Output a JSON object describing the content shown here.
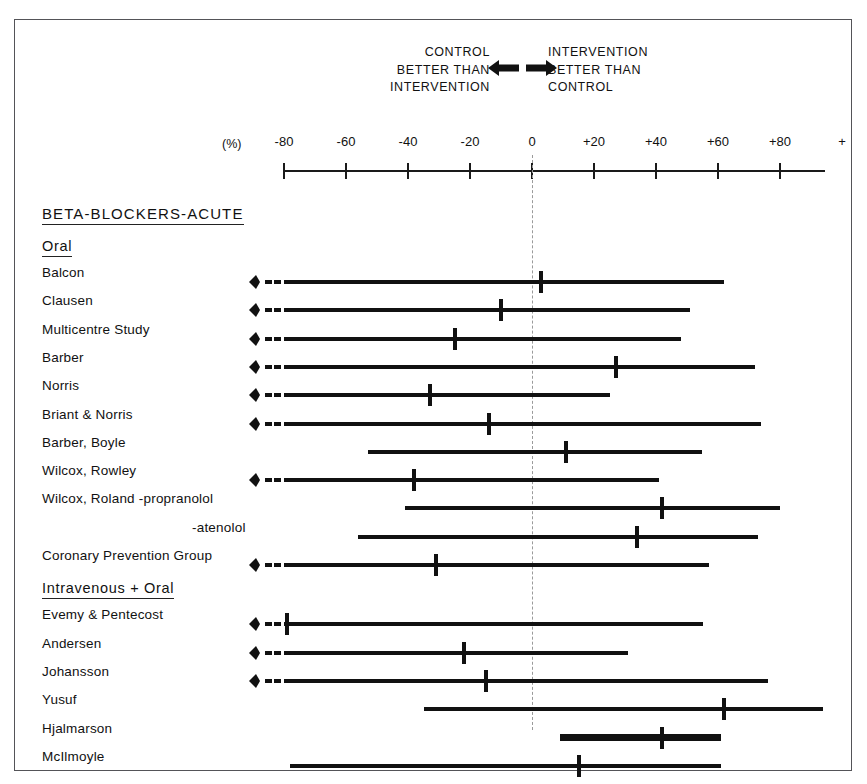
{
  "figure": {
    "frame_color": "#545458",
    "ink_color": "#111111",
    "zero_line_color": "#9a9a9a"
  },
  "legend": {
    "left_line1": "CONTROL",
    "left_line2": "BETTER THAN",
    "left_line3": "INTERVENTION",
    "right_line1": "INTERVENTION",
    "right_line2": "BETTER THAN",
    "right_line3": "CONTROL",
    "left_arrow_icon": "arrow-left-bold",
    "right_arrow_icon": "arrow-right-bold"
  },
  "axis": {
    "unit_label": "(%)",
    "tick_labels": [
      "-80",
      "-60",
      "-40",
      "-20",
      "0",
      "+20",
      "+40",
      "+60",
      "+80",
      "+"
    ],
    "tick_values": [
      -80,
      -60,
      -40,
      -20,
      0,
      20,
      40,
      60,
      80,
      100
    ],
    "range": [
      -80,
      100
    ],
    "zero_value": 0
  },
  "sections": [
    {
      "title": "BETA-BLOCKERS-ACUTE",
      "level": "major"
    },
    {
      "title": "Oral",
      "level": "minor"
    },
    {
      "title": "Intravenous + Oral",
      "level": "minor"
    }
  ],
  "chart_data": {
    "type": "forest",
    "title": "BETA-BLOCKERS-ACUTE",
    "xlabel": "(%)",
    "ylabel": "",
    "xlim": [
      -80,
      100
    ],
    "grid": false,
    "zero_reference": 0,
    "left_annotation": "CONTROL BETTER THAN INTERVENTION",
    "right_annotation": "INTERVENTION BETTER THAN CONTROL",
    "groups": [
      {
        "name": "Oral",
        "studies": [
          {
            "label": "Balcon",
            "estimate": 3,
            "ci_low": -80,
            "ci_high": 62,
            "left_truncated": true
          },
          {
            "label": "Clausen",
            "estimate": -10,
            "ci_low": -80,
            "ci_high": 51,
            "left_truncated": true
          },
          {
            "label": "Multicentre Study",
            "estimate": -25,
            "ci_low": -80,
            "ci_high": 48,
            "left_truncated": true
          },
          {
            "label": "Barber",
            "estimate": 27,
            "ci_low": -80,
            "ci_high": 72,
            "left_truncated": true
          },
          {
            "label": "Norris",
            "estimate": -33,
            "ci_low": -80,
            "ci_high": 25,
            "left_truncated": true
          },
          {
            "label": "Briant & Norris",
            "estimate": -14,
            "ci_low": -80,
            "ci_high": 74,
            "left_truncated": true
          },
          {
            "label": "Barber, Boyle",
            "estimate": 11,
            "ci_low": -53,
            "ci_high": 55,
            "left_truncated": false
          },
          {
            "label": "Wilcox, Rowley",
            "estimate": -38,
            "ci_low": -80,
            "ci_high": 41,
            "left_truncated": true
          },
          {
            "label": "Wilcox, Roland -propranolol",
            "estimate": 42,
            "ci_low": -41,
            "ci_high": 80,
            "left_truncated": false
          },
          {
            "label": "-atenolol",
            "estimate": 34,
            "ci_low": -56,
            "ci_high": 73,
            "left_truncated": false,
            "continuation": true
          },
          {
            "label": "Coronary Prevention Group",
            "estimate": -31,
            "ci_low": -80,
            "ci_high": 57,
            "left_truncated": true
          }
        ]
      },
      {
        "name": "Intravenous + Oral",
        "studies": [
          {
            "label": "Evemy & Pentecost",
            "estimate": -79,
            "ci_low": -80,
            "ci_high": 55,
            "left_truncated": true
          },
          {
            "label": "Andersen",
            "estimate": -22,
            "ci_low": -80,
            "ci_high": 31,
            "left_truncated": true
          },
          {
            "label": "Johansson",
            "estimate": -15,
            "ci_low": -80,
            "ci_high": 76,
            "left_truncated": true
          },
          {
            "label": "Yusuf",
            "estimate": 62,
            "ci_low": -35,
            "ci_high": 94,
            "left_truncated": false
          },
          {
            "label": "Hjalmarson",
            "estimate": 42,
            "ci_low": 9,
            "ci_high": 61,
            "left_truncated": false,
            "emphasis": true
          },
          {
            "label": "McIlmoyle",
            "estimate": 15,
            "ci_low": -78,
            "ci_high": 61,
            "left_truncated": false
          }
        ]
      }
    ]
  }
}
